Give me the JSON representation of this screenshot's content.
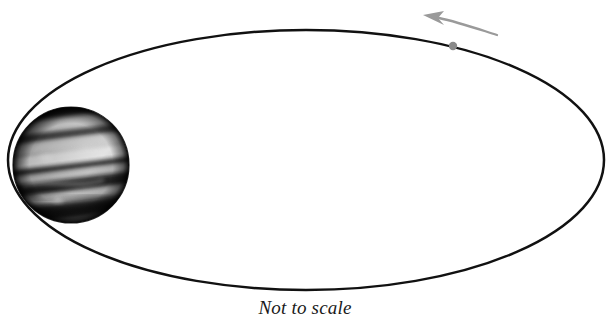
{
  "figure": {
    "caption": "Not to scale",
    "background_color": "#ffffff"
  },
  "orbit": {
    "name": "orbital-path",
    "shape": "ellipse",
    "center_x": 306,
    "center_y": 160,
    "radius_x": 298,
    "radius_y": 130,
    "stroke_color": "#111111",
    "stroke_width": 2.5,
    "fill": "none"
  },
  "planet": {
    "name": "planet-jupiter",
    "center_x": 71,
    "center_y": 165,
    "radius": 58,
    "base_color": "#8d8d8d",
    "dark_band_color": "#1c1c1c",
    "light_band_color": "#ededed",
    "shadow_color": "#050505",
    "band_tilt_degrees": -7
  },
  "satellite": {
    "name": "satellite-dot",
    "center_x": 453,
    "center_y": 46,
    "radius": 4.2,
    "color": "#8a8a8a"
  },
  "direction_arrow": {
    "name": "orbit-direction-arrow",
    "color": "#9a9a9a",
    "tail_start_x": 496,
    "tail_start_y": 34,
    "tail_end_x": 436,
    "tail_end_y": 19,
    "tip_x": 423,
    "tip_y": 16,
    "stroke_width": 2.2,
    "meaning": "counterclockwise orbital motion"
  },
  "colors": {
    "ink": "#111111",
    "gray_accent": "#9a9a9a",
    "paper": "#ffffff"
  }
}
